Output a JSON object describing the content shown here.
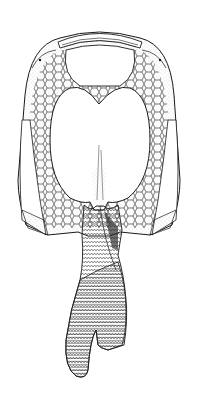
{
  "image": {
    "subject": "fossil armored fish illustration, ventral view",
    "style": "black ink line drawing with stippling",
    "colors": {
      "background": "#ffffff",
      "ink": "#1a1a1a",
      "stipple": "#555555"
    },
    "parts": [
      "head-shield",
      "rostral-plate",
      "orbits",
      "central-ventral-plate",
      "polygonal-platelets",
      "lateral-plates",
      "cornual-processes",
      "scaled-trunk",
      "tail-fin"
    ]
  }
}
